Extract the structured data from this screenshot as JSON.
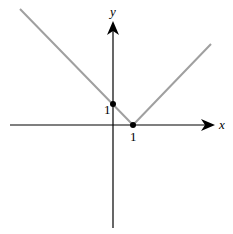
{
  "diagram": {
    "axes": {
      "x_label": "x",
      "y_label": "y"
    },
    "ticks": {
      "x_tick_label": "1",
      "y_tick_label": "1"
    },
    "points": [
      {
        "label": "(0, 1)",
        "x": 0,
        "y": 1
      },
      {
        "label": "(1, 0)",
        "x": 1,
        "y": 0
      }
    ],
    "colors": {
      "graph_line": "#a0a0a0",
      "axes": "#000000"
    }
  }
}
